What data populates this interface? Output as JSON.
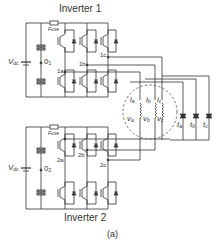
{
  "diagram": {
    "caption": "(a)",
    "inverter1": {
      "title": "Inverter 1",
      "fuse_label": "Fuse",
      "source_label": "V",
      "source_sub": "dc",
      "midpoint_label": "0",
      "midpoint_sub": "1",
      "nodes": [
        "1a",
        "1b",
        "1c"
      ],
      "switches_top": [
        "S1a",
        "S1b",
        "S1c"
      ],
      "switches_bottom": [
        "S1a'",
        "S1b'",
        "S1c'"
      ]
    },
    "inverter2": {
      "title": "Inverter 2",
      "fuse_label": "Fuse",
      "source_label": "V",
      "source_sub": "dc",
      "midpoint_label": "0",
      "midpoint_sub": "2",
      "nodes": [
        "2a",
        "2b",
        "2c"
      ],
      "switches_top": [
        "S2a",
        "S2b",
        "S2c"
      ],
      "switches_bottom": [
        "S2a'",
        "S2b'",
        "S2c'"
      ]
    },
    "machine": {
      "currents": [
        "i",
        "i",
        "i"
      ],
      "current_subs": [
        "a",
        "b",
        "c"
      ],
      "voltages": [
        "v",
        "v",
        "v"
      ],
      "voltage_subs": [
        "a",
        "b",
        "c"
      ]
    },
    "triacs": {
      "labels": [
        "t",
        "t",
        "t"
      ],
      "subs": [
        "a",
        "b",
        "c"
      ]
    },
    "colors": {
      "line": "#333333",
      "dashed": "#555555"
    }
  }
}
